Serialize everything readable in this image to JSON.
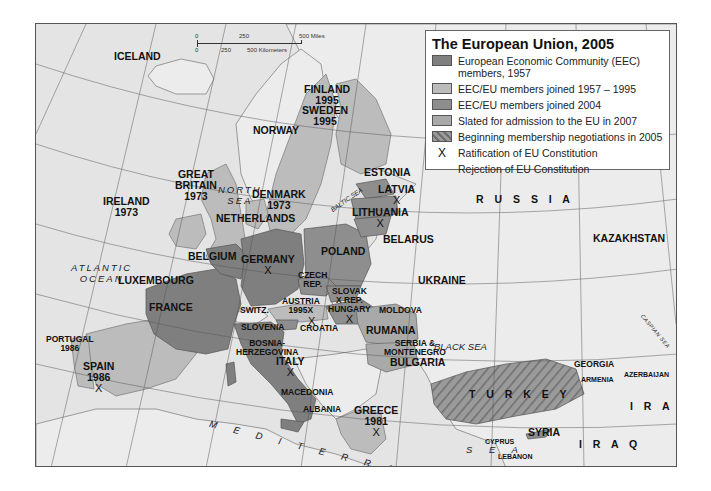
{
  "title": "The European Union, 2005",
  "colors": {
    "sea": "#e4e4e4",
    "non_eu_land": "#ececec",
    "eec_1957": "#7f7f7f",
    "joined_1957_1995": "#bcbcbc",
    "joined_2004": "#8e8e8e",
    "slated_2007": "#a9a9a9",
    "negotiations_2005": "#8a8a8a",
    "graticule": "#555555"
  },
  "legend": {
    "title": "The European Union, 2005",
    "items": [
      {
        "type": "swatch",
        "key": "eec_1957",
        "label": "European Economic Community (EEC)",
        "label2": "members, 1957"
      },
      {
        "type": "swatch",
        "key": "joined_1957_1995",
        "label": "EEC/EU members joined 1957 – 1995"
      },
      {
        "type": "swatch",
        "key": "joined_2004",
        "label": "EEC/EU members joined 2004"
      },
      {
        "type": "swatch",
        "key": "slated_2007",
        "label": "Slated for admission to the EU in 2007"
      },
      {
        "type": "hatch",
        "key": "negotiations_2005",
        "label": "Beginning membership negotiations in 2005"
      },
      {
        "type": "symbol",
        "symbol": "X",
        "label": "Ratification of EU Constitution"
      },
      {
        "type": "symbol",
        "symbol": "",
        "label": "Rejection of EU Constitution"
      }
    ]
  },
  "scale_bar": {
    "miles": {
      "ticks": [
        "0",
        "250",
        "500 Miles"
      ]
    },
    "kilometers": {
      "ticks": [
        "0",
        "250",
        "500 Kilometers"
      ]
    }
  },
  "countries": {
    "iceland": {
      "name": "ICELAND"
    },
    "norway": {
      "name": "NORWAY"
    },
    "sweden": {
      "name": "SWEDEN",
      "year": "1995"
    },
    "finland": {
      "name": "FINLAND",
      "year": "1995"
    },
    "estonia": {
      "name": "ESTONIA"
    },
    "latvia": {
      "name": "LATVIA",
      "mark": "X"
    },
    "lithuania": {
      "name": "LITHUANIA",
      "mark": "X"
    },
    "russia": {
      "name": "R U S S I A"
    },
    "kazakhstan": {
      "name": "KAZAKHSTAN"
    },
    "great_britain": {
      "name1": "GREAT",
      "name2": "BRITAIN",
      "year": "1973"
    },
    "ireland": {
      "name": "IRELAND",
      "year": "1973"
    },
    "denmark": {
      "name": "DENMARK",
      "year": "1973"
    },
    "netherlands": {
      "name": "NETHERLANDS"
    },
    "belgium": {
      "name": "BELGIUM"
    },
    "luxembourg": {
      "name": "LUXEMBOURG"
    },
    "germany": {
      "name": "GERMANY",
      "mark": "X"
    },
    "poland": {
      "name": "POLAND"
    },
    "belarus": {
      "name": "BELARUS"
    },
    "ukraine": {
      "name": "UKRAINE"
    },
    "czech_rep": {
      "name1": "CZECH",
      "name2": "REP."
    },
    "slovak_rep": {
      "name1": "SLOVAK",
      "name2": "X REP."
    },
    "austria": {
      "name": "AUSTRIA",
      "year": "1995X"
    },
    "hungary": {
      "name": "HUNGARY",
      "mark": "X"
    },
    "moldova": {
      "name": "MOLDOVA"
    },
    "rumania": {
      "name": "RUMANIA"
    },
    "france": {
      "name": "FRANCE"
    },
    "switzerland": {
      "name": "SWITZ."
    },
    "slovenia": {
      "name": "SLOVENIA",
      "mark": "X"
    },
    "croatia": {
      "name": "CROATIA"
    },
    "bosnia": {
      "name1": "BOSNIA-",
      "name2": "HERZEGOVINA"
    },
    "serbia": {
      "name1": "SERBIA &",
      "name2": "MONTENEGRO"
    },
    "bulgaria": {
      "name": "BULGARIA"
    },
    "italy": {
      "name": "ITALY",
      "mark": "X"
    },
    "macedonia": {
      "name": "MACEDONIA"
    },
    "albania": {
      "name": "ALBANIA"
    },
    "greece": {
      "name": "GREECE",
      "year": "1981",
      "mark": "X"
    },
    "portugal": {
      "name": "PORTUGAL",
      "year": "1986"
    },
    "spain": {
      "name": "SPAIN",
      "year": "1986",
      "mark": "X"
    },
    "turkey": {
      "name": "T U R K E Y"
    },
    "georgia": {
      "name": "GEORGIA"
    },
    "armenia": {
      "name": "ARMENIA"
    },
    "azerbaijan": {
      "name": "AZERBAIJAN"
    },
    "iran": {
      "name": "I R A N"
    },
    "iraq": {
      "name": "I R A Q"
    },
    "syria": {
      "name": "SYRIA"
    },
    "cyprus": {
      "name": "CYPRUS"
    },
    "lebanon": {
      "name": "LEBANON"
    }
  },
  "seas": {
    "north_sea": {
      "line1": "NORTH",
      "line2": "SEA"
    },
    "baltic_sea": {
      "name": "BALTIC SEA"
    },
    "atlantic": {
      "line1": "ATLANTIC",
      "line2": "OCEAN"
    },
    "black_sea": {
      "name": "BLACK SEA"
    },
    "caspian_sea": {
      "name": "CASPIAN SEA"
    },
    "mediterranean": {
      "name": "M E D I T E R R A N E A N",
      "tail": "S E A"
    }
  }
}
